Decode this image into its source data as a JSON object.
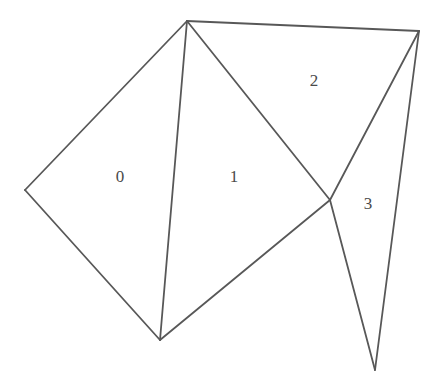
{
  "figure": {
    "width": 442,
    "height": 387,
    "background_color": "#ffffff",
    "stroke_color": "#585858",
    "stroke_width": 1.8,
    "label_color": "#4a4a4a",
    "label_font_size": 17
  },
  "vertices": [
    {
      "id": "v0",
      "name": "apex-top",
      "x": 187,
      "y": 21
    },
    {
      "id": "v1",
      "name": "top-right",
      "x": 419,
      "y": 31
    },
    {
      "id": "v2",
      "name": "left",
      "x": 25,
      "y": 190
    },
    {
      "id": "v3",
      "name": "crossing-center",
      "x": 330,
      "y": 200
    },
    {
      "id": "v4",
      "name": "bottom",
      "x": 160,
      "y": 340
    },
    {
      "id": "v5",
      "name": "spike-bottom",
      "x": 375,
      "y": 370
    }
  ],
  "edges": [
    {
      "id": "e0",
      "name": "apex-to-left",
      "from": "v0",
      "to": "v2",
      "points": "187,21 25,190"
    },
    {
      "id": "e1",
      "name": "left-to-bottom",
      "from": "v2",
      "to": "v4",
      "points": "25,190 160,340"
    },
    {
      "id": "e2",
      "name": "apex-to-bottom",
      "from": "v0",
      "to": "v4",
      "points": "187,21 160,340"
    },
    {
      "id": "e3",
      "name": "apex-to-top-right",
      "from": "v0",
      "to": "v1",
      "points": "187,21 419,31"
    },
    {
      "id": "e4",
      "name": "apex-to-crossing",
      "from": "v0",
      "to": "v3",
      "points": "187,21 330,200"
    },
    {
      "id": "e5",
      "name": "bottom-to-crossing",
      "from": "v4",
      "to": "v3",
      "points": "160,340 330,200"
    },
    {
      "id": "e6",
      "name": "crossing-to-top-right",
      "from": "v3",
      "to": "v1",
      "points": "330,200 419,31"
    },
    {
      "id": "e7",
      "name": "crossing-to-spike-bottom",
      "from": "v3",
      "to": "v5",
      "points": "330,200 375,370"
    },
    {
      "id": "e8",
      "name": "top-right-to-spike-bottom",
      "from": "v1",
      "to": "v5",
      "points": "419,31 375,370"
    }
  ],
  "regions": [
    {
      "id": "r0",
      "label": "0",
      "name": "region-0",
      "polygon": "187,21 25,190 160,340",
      "label_x": 120,
      "label_y": 178
    },
    {
      "id": "r1",
      "label": "1",
      "name": "region-1",
      "polygon": "187,21 330,200 160,340",
      "label_x": 234,
      "label_y": 178
    },
    {
      "id": "r2",
      "label": "2",
      "name": "region-2",
      "polygon": "187,21 419,31 330,200",
      "label_x": 314,
      "label_y": 82
    },
    {
      "id": "r3",
      "label": "3",
      "name": "region-3",
      "polygon": "330,200 419,31 375,370",
      "label_x": 368,
      "label_y": 205
    }
  ]
}
